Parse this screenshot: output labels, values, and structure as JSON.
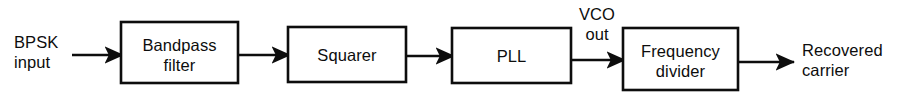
{
  "figure": {
    "type": "block-diagram",
    "background_color": "#ffffff",
    "line_color": "#0d0d0d",
    "text_color": "#0d0d0d",
    "width": 900,
    "height": 105
  },
  "blocks": [
    {
      "id": "bandpass-filter",
      "line1": "Bandpass",
      "line2": "filter",
      "x": 121,
      "y": 22,
      "w": 117,
      "h": 61
    },
    {
      "id": "squarer",
      "line1": "Squarer",
      "line2": "",
      "x": 288,
      "y": 27,
      "w": 118,
      "h": 55
    },
    {
      "id": "pll",
      "line1": "PLL",
      "line2": "",
      "x": 452,
      "y": 28,
      "w": 119,
      "h": 55
    },
    {
      "id": "frequency-divider",
      "line1": "Frequency",
      "line2": "divider",
      "x": 623,
      "y": 28,
      "w": 115,
      "h": 62
    }
  ],
  "labels": {
    "input": {
      "line1": "BPSK",
      "line2": "input",
      "x": 14,
      "y": 44,
      "anchor": "start"
    },
    "vco_out": {
      "line1": "VCO",
      "line2": "out",
      "x": 597,
      "y": 18,
      "anchor": "middle"
    },
    "output": {
      "line1": "Recovered",
      "line2": "carrier",
      "x": 800,
      "y": 56,
      "anchor": "start"
    }
  },
  "connections": [
    {
      "id": "input-to-bandpass",
      "from": "BPSK input",
      "to": "Bandpass filter",
      "x1": 72,
      "x2": 121,
      "y": 55
    },
    {
      "id": "bandpass-to-squarer",
      "from": "Bandpass filter",
      "to": "Squarer",
      "x1": 238,
      "x2": 288,
      "y": 55
    },
    {
      "id": "squarer-to-pll",
      "from": "Squarer",
      "to": "PLL",
      "x1": 406,
      "x2": 452,
      "y": 56
    },
    {
      "id": "pll-to-divider",
      "from": "PLL",
      "to": "Frequency divider",
      "x1": 571,
      "x2": 623,
      "y": 60
    },
    {
      "id": "divider-to-output",
      "from": "Frequency divider",
      "to": "Recovered carrier",
      "x1": 738,
      "x2": 792,
      "y": 62
    }
  ]
}
